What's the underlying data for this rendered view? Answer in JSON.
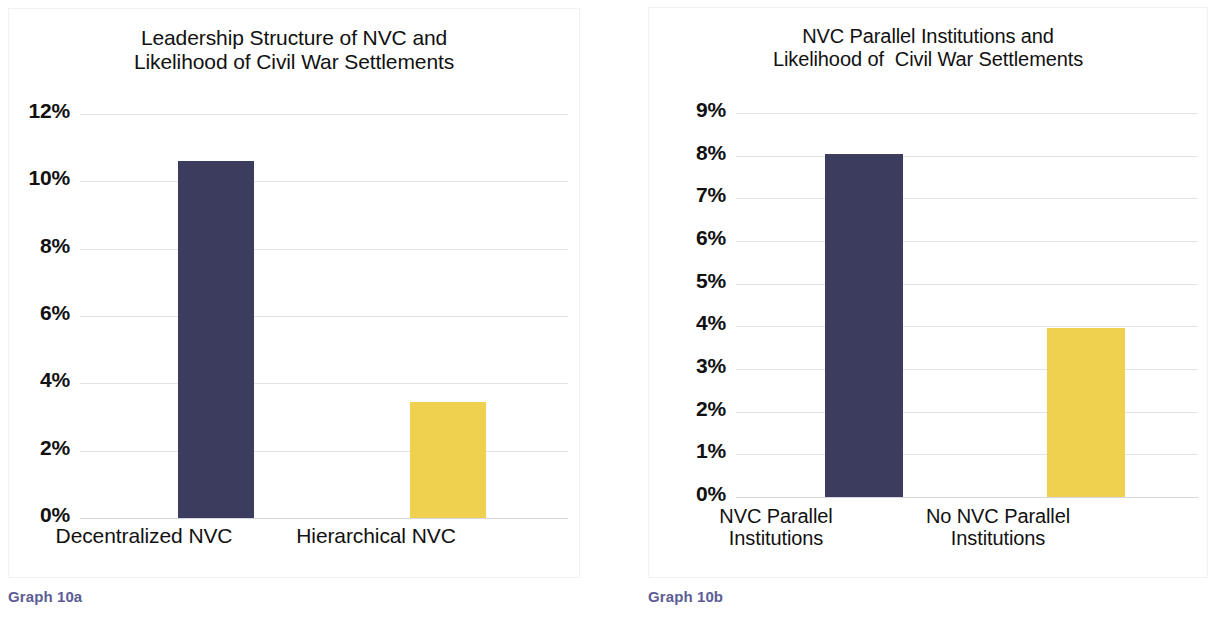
{
  "figure": {
    "background_color": "#ffffff",
    "navy_color": "#3c3c5e",
    "gold_color": "#efd14f",
    "caption_color": "#5c5c96",
    "gridline_color": "#e2e2e8"
  },
  "panel_a": {
    "caption": "Graph 10a",
    "title_line1": "Leadership Structure of NVC and",
    "title_line2": "Likelihood of Civil War Settlements",
    "ticks": [
      "12%",
      "10%",
      "8%",
      "6%",
      "4%",
      "2%",
      "0%"
    ],
    "bars": [
      {
        "label": "Decentralized NVC",
        "value": 10.6,
        "color": "#3c3c5e"
      },
      {
        "label": "Hierarchical NVC",
        "value": 3.45,
        "color": "#efd14f"
      }
    ]
  },
  "panel_b": {
    "caption": "Graph 10b",
    "title_line1": "NVC Parallel Institutions and",
    "title_line2": "Likelihood of  Civil War Settlements",
    "ticks": [
      "9%",
      "8%",
      "7%",
      "6%",
      "5%",
      "4%",
      "3%",
      "2%",
      "1%",
      "0%"
    ],
    "bars": [
      {
        "label": "NVC Parallel\nInstitutions",
        "value": 8.05,
        "color": "#3c3c5e"
      },
      {
        "label": "No NVC Parallel\nInstitutions",
        "value": 3.95,
        "color": "#efd14f"
      }
    ]
  },
  "chart_data": [
    {
      "type": "bar",
      "id": "graph-10a",
      "title": "Leadership Structure of NVC and Likelihood of Civil War Settlements",
      "caption": "Graph 10a",
      "categories": [
        "Decentralized NVC",
        "Hierarchical NVC"
      ],
      "values": [
        10.6,
        3.45
      ],
      "value_unit": "%",
      "bar_colors": [
        "#3c3c5e",
        "#efd14f"
      ],
      "xlabel": "",
      "ylabel": "",
      "ylim": [
        0,
        12
      ],
      "ytick_values": [
        0,
        2,
        4,
        6,
        8,
        10,
        12
      ],
      "ytick_labels": [
        "0%",
        "2%",
        "4%",
        "6%",
        "8%",
        "10%",
        "12%"
      ],
      "grid": true,
      "legend": "none"
    },
    {
      "type": "bar",
      "id": "graph-10b",
      "title": "NVC Parallel Institutions and Likelihood of  Civil War Settlements",
      "caption": "Graph 10b",
      "categories": [
        "NVC Parallel Institutions",
        "No NVC Parallel Institutions"
      ],
      "values": [
        8.05,
        3.95
      ],
      "value_unit": "%",
      "bar_colors": [
        "#3c3c5e",
        "#efd14f"
      ],
      "xlabel": "",
      "ylabel": "",
      "ylim": [
        0,
        9
      ],
      "ytick_values": [
        0,
        1,
        2,
        3,
        4,
        5,
        6,
        7,
        8,
        9
      ],
      "ytick_labels": [
        "0%",
        "1%",
        "2%",
        "3%",
        "4%",
        "5%",
        "6%",
        "7%",
        "8%",
        "9%"
      ],
      "grid": true,
      "legend": "none"
    }
  ]
}
